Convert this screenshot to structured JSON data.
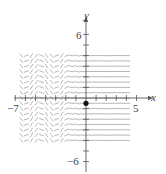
{
  "figure": {
    "type": "slope-field",
    "axes": {
      "x_label": "x",
      "y_label": "y",
      "x_tick_labels": [
        {
          "value": -7,
          "text": "−7"
        },
        {
          "value": 5,
          "text": "5"
        }
      ],
      "y_tick_labels": [
        {
          "value": 6,
          "text": "6"
        },
        {
          "value": -6,
          "text": "−6"
        }
      ],
      "x_range": [
        -7,
        5
      ],
      "y_range": [
        -6,
        6
      ],
      "x_tick_step": 1,
      "y_tick_step": 1
    },
    "field": {
      "x_extent": [
        -6.4,
        4.4
      ],
      "y_extent": [
        -4,
        4.2
      ],
      "grid_step": 0.5,
      "description": "Slope depends on x only; segments tilted periodically for x < about -2, nearly flat for x > 0",
      "segment_color": "#9a9a9a"
    },
    "initial_point": {
      "x": 0,
      "y": -0.5,
      "color": "#111111"
    },
    "colors": {
      "axis": "#555555",
      "text": "#444444",
      "background": "#ffffff"
    }
  }
}
